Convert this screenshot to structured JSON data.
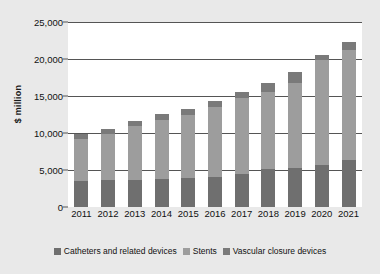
{
  "chart_data": {
    "type": "bar",
    "stacked": true,
    "title": "",
    "xlabel": "",
    "ylabel": "$ million",
    "ylim": [
      0,
      25000
    ],
    "yticks": [
      0,
      5000,
      10000,
      15000,
      20000,
      25000
    ],
    "ytick_labels": [
      "0",
      "5,000",
      "10,000",
      "15,000",
      "20,000",
      "25,000"
    ],
    "grid": true,
    "legend_position": "bottom",
    "categories": [
      "2011",
      "2012",
      "2013",
      "2014",
      "2015",
      "2016",
      "2017",
      "2018",
      "2019",
      "2020",
      "2021"
    ],
    "series": [
      {
        "name": "Catheters and related devices",
        "color": "#6f6f6f",
        "values": [
          3500,
          3600,
          3700,
          3750,
          3900,
          4050,
          4450,
          5100,
          5250,
          5700,
          6300
        ]
      },
      {
        "name": "Stents",
        "color": "#9d9d9d",
        "values": [
          5700,
          6300,
          7250,
          8050,
          8550,
          9400,
          10300,
          10400,
          11450,
          14150,
          14950
        ]
      },
      {
        "name": "Vascular closure devices",
        "color": "#7a7a7a",
        "values": [
          700,
          700,
          700,
          750,
          800,
          850,
          800,
          1300,
          1500,
          700,
          1050
        ]
      }
    ],
    "totals": [
      9900,
      10600,
      11650,
      12550,
      13250,
      14300,
      15550,
      16800,
      18200,
      20550,
      22300
    ]
  },
  "legend": {
    "items": [
      {
        "label": "Catheters and related devices",
        "color": "#6f6f6f"
      },
      {
        "label": "Stents",
        "color": "#9d9d9d"
      },
      {
        "label": "Vascular closure devices",
        "color": "#7a7a7a"
      }
    ]
  },
  "colors": {
    "background": "#e9e9e9",
    "plot_background": "#ffffff",
    "gridline": "#555555",
    "text": "#111111"
  }
}
